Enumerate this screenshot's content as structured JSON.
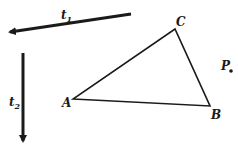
{
  "diagram": {
    "vectors": [
      {
        "name": "t1",
        "label": "t",
        "subscript": "1",
        "from": [
          131,
          14
        ],
        "to": [
          4,
          33
        ]
      },
      {
        "name": "t2",
        "label": "t",
        "subscript": "2",
        "from": [
          23,
          53
        ],
        "to": [
          23,
          147
        ]
      }
    ],
    "triangle": {
      "vertices": [
        {
          "name": "A",
          "label": "A",
          "x": 73,
          "y": 99
        },
        {
          "name": "B",
          "label": "B",
          "x": 210,
          "y": 106
        },
        {
          "name": "C",
          "label": "C",
          "x": 175,
          "y": 29
        }
      ]
    },
    "point": {
      "name": "P",
      "label": "P",
      "x": 231,
      "y": 71
    },
    "colors": {
      "ink": "#1a1a1a",
      "background": "#ffffff"
    }
  }
}
